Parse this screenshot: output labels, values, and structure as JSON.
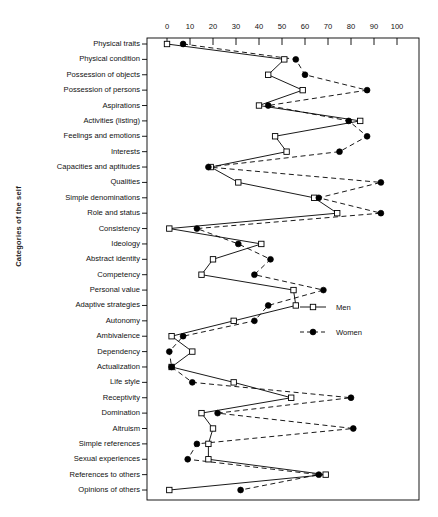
{
  "chart_data": {
    "type": "line",
    "orientation": "horizontal",
    "title": "",
    "xlabel": "",
    "ylabel": "Categories of the self",
    "xlim": [
      0,
      100
    ],
    "xticks": [
      0,
      10,
      20,
      30,
      40,
      50,
      60,
      70,
      80,
      90,
      100
    ],
    "xtick_labels": [
      "0",
      "10",
      "20",
      "30",
      "40",
      "50",
      "60",
      "70",
      "80",
      "90",
      "100"
    ],
    "grid": false,
    "legend_position": "center-right",
    "categories": [
      "Physical traits",
      "Physical condition",
      "Possession of objects",
      "Possession of persons",
      "Aspirations",
      "Activities (listing)",
      "Feelings and emotions",
      "Interests",
      "Capacities and aptitudes",
      "Qualities",
      "Simple denominations",
      "Role and status",
      "Consistency",
      "Ideology",
      "Abstract identity",
      "Competency",
      "Personal value",
      "Adaptive strategies",
      "Autonomy",
      "Ambivalence",
      "Dependency",
      "Actualization",
      "Life style",
      "Receptivity",
      "Domination",
      "Altruism",
      "Simple references",
      "Sexual experiences",
      "References to others",
      "Opinions of others"
    ],
    "series": [
      {
        "name": "Men",
        "marker": "open-square",
        "line": "solid",
        "values": [
          0,
          51,
          44,
          59,
          40,
          84,
          47,
          52,
          19,
          31,
          64,
          74,
          1,
          41,
          20,
          15,
          55,
          56,
          29,
          2,
          11,
          2,
          29,
          54,
          15,
          20,
          18,
          18,
          69,
          1
        ]
      },
      {
        "name": "Women",
        "marker": "filled-circle",
        "line": "dashed",
        "values": [
          7,
          56,
          60,
          87,
          44,
          79,
          87,
          75,
          18,
          93,
          66,
          93,
          13,
          31,
          45,
          38,
          68,
          44,
          38,
          7,
          1,
          2,
          11,
          80,
          22,
          81,
          13,
          9,
          66,
          32
        ]
      }
    ]
  },
  "legend": {
    "entries": [
      {
        "label": "Men"
      },
      {
        "label": "Women"
      }
    ]
  }
}
